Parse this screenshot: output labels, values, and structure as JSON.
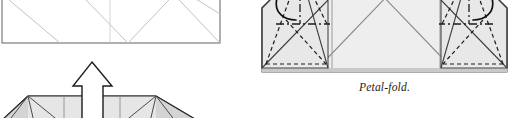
{
  "page": {
    "kind": "book-page-scan",
    "background_color": "#ffffff",
    "width": 513,
    "height": 118
  },
  "palette": {
    "paper_white": "#ffffff",
    "paper_fill_light": "#ededed",
    "paper_fill_mid": "#e3e3e3",
    "paper_fill_dark": "#d8d8d8",
    "crease_gray": "#9a9a9a",
    "edge_black": "#1c1c1c",
    "arrow_black": "#111111",
    "caption_color": "#1a1a1a"
  },
  "figures": [
    {
      "id": "fig-top-left",
      "name": "preceding-step-diagram",
      "description": "Cropped bottom portion of a square origami sheet with faint diagonal crease lines and a curved black motion arrow pointing down-left.",
      "cropped_edge": "top",
      "has_caption": false,
      "annotations": [
        {
          "name": "curved-motion-arrow",
          "type": "curved-arrow",
          "direction": "down-left",
          "color": "#111111"
        }
      ]
    },
    {
      "id": "fig-petal",
      "name": "petal-fold-diagram",
      "description": "Wide low origami form, light gray, with mirrored left and right flaps showing dashed valley-fold lines, dash-dot mountain-fold lines, looping curved arrows and solid arrowheads; large X of crease lines across the center.",
      "cropped_edge": "top",
      "has_caption": true,
      "caption": "Petal-fold.",
      "annotations": [
        {
          "name": "left-loop-arrow",
          "type": "looping-curved-arrow",
          "direction": "right",
          "color": "#111111"
        },
        {
          "name": "right-loop-arrow",
          "type": "looping-curved-arrow",
          "direction": "left",
          "color": "#111111"
        },
        {
          "name": "left-valley-fold-line",
          "type": "dashed-line",
          "color": "#1c1c1c"
        },
        {
          "name": "right-valley-fold-line",
          "type": "dashed-line",
          "color": "#1c1c1c"
        },
        {
          "name": "left-mountain-fold-line",
          "type": "dash-dot-line",
          "color": "#1c1c1c"
        },
        {
          "name": "right-mountain-fold-line",
          "type": "dash-dot-line",
          "color": "#1c1c1c"
        }
      ]
    },
    {
      "id": "fig-bot-left",
      "name": "following-step-diagram",
      "description": "Cropped top portion of a wide gray origami form with radiating crease lines and a large hollow white push arrow pointing up from the center.",
      "cropped_edge": "bottom",
      "has_caption": false,
      "annotations": [
        {
          "name": "hollow-push-arrow",
          "type": "hollow-arrow",
          "direction": "up",
          "fill": "#ffffff",
          "stroke": "#1c1c1c"
        }
      ]
    }
  ],
  "captions": {
    "petal_fold": "Petal-fold."
  }
}
